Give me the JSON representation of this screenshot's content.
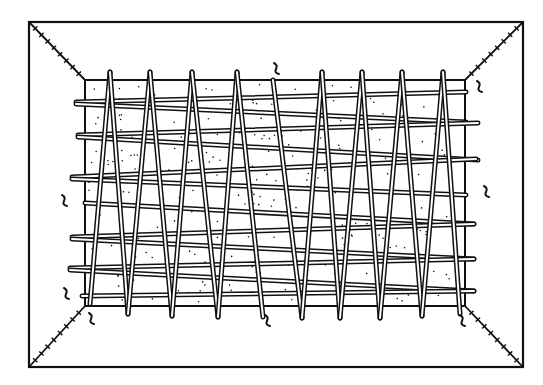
{
  "figure": {
    "colors": {
      "background": "#ffffff",
      "ink": "#111111",
      "panel_fill": "#ffffff"
    },
    "outer_frame": {
      "x1": 29,
      "y1": 22,
      "x2": 523,
      "y2": 367
    },
    "inner_panel": {
      "x1": 85,
      "y1": 80,
      "x2": 465,
      "y2": 306
    },
    "v_sticks": [
      {
        "x1": 90,
        "y1": 304,
        "x2": 110,
        "y2": 72
      },
      {
        "x1": 110,
        "y1": 72,
        "x2": 128,
        "y2": 314
      },
      {
        "x1": 128,
        "y1": 314,
        "x2": 150,
        "y2": 72
      },
      {
        "x1": 150,
        "y1": 72,
        "x2": 172,
        "y2": 316
      },
      {
        "x1": 172,
        "y1": 316,
        "x2": 192,
        "y2": 72
      },
      {
        "x1": 192,
        "y1": 72,
        "x2": 218,
        "y2": 317
      },
      {
        "x1": 218,
        "y1": 317,
        "x2": 237,
        "y2": 72
      },
      {
        "x1": 237,
        "y1": 72,
        "x2": 263,
        "y2": 317
      },
      {
        "x1": 273,
        "y1": 80,
        "x2": 302,
        "y2": 318
      },
      {
        "x1": 302,
        "y1": 318,
        "x2": 322,
        "y2": 72
      },
      {
        "x1": 322,
        "y1": 72,
        "x2": 340,
        "y2": 318
      },
      {
        "x1": 340,
        "y1": 318,
        "x2": 362,
        "y2": 72
      },
      {
        "x1": 362,
        "y1": 72,
        "x2": 380,
        "y2": 318
      },
      {
        "x1": 380,
        "y1": 318,
        "x2": 402,
        "y2": 72
      },
      {
        "x1": 402,
        "y1": 72,
        "x2": 422,
        "y2": 316
      },
      {
        "x1": 422,
        "y1": 316,
        "x2": 443,
        "y2": 72
      },
      {
        "x1": 443,
        "y1": 72,
        "x2": 460,
        "y2": 314
      }
    ],
    "h_sticks": [
      {
        "x1": 76,
        "y1": 102,
        "x2": 466,
        "y2": 92
      },
      {
        "x1": 76,
        "y1": 104,
        "x2": 466,
        "y2": 122
      },
      {
        "x1": 78,
        "y1": 135,
        "x2": 478,
        "y2": 123
      },
      {
        "x1": 78,
        "y1": 137,
        "x2": 478,
        "y2": 160
      },
      {
        "x1": 72,
        "y1": 177,
        "x2": 476,
        "y2": 159
      },
      {
        "x1": 72,
        "y1": 179,
        "x2": 466,
        "y2": 195
      },
      {
        "x1": 85,
        "y1": 203,
        "x2": 474,
        "y2": 224
      },
      {
        "x1": 72,
        "y1": 237,
        "x2": 474,
        "y2": 224
      },
      {
        "x1": 72,
        "y1": 239,
        "x2": 474,
        "y2": 259
      },
      {
        "x1": 70,
        "y1": 268,
        "x2": 474,
        "y2": 259
      },
      {
        "x1": 70,
        "y1": 270,
        "x2": 474,
        "y2": 291
      },
      {
        "x1": 82,
        "y1": 296,
        "x2": 474,
        "y2": 291
      }
    ],
    "corner_seams": [
      {
        "name": "top-left",
        "x1": 29,
        "y1": 22,
        "x2": 85,
        "y2": 80
      },
      {
        "name": "top-right",
        "x1": 523,
        "y1": 22,
        "x2": 465,
        "y2": 80
      },
      {
        "name": "bottom-left",
        "x1": 29,
        "y1": 367,
        "x2": 85,
        "y2": 306
      },
      {
        "name": "bottom-right",
        "x1": 523,
        "y1": 367,
        "x2": 465,
        "y2": 306
      }
    ],
    "ties": [
      {
        "x": 277,
        "y": 68
      },
      {
        "x": 480,
        "y": 86
      },
      {
        "x": 487,
        "y": 191
      },
      {
        "x": 65,
        "y": 200
      },
      {
        "x": 67,
        "y": 293
      },
      {
        "x": 92,
        "y": 318
      },
      {
        "x": 268,
        "y": 320
      },
      {
        "x": 463,
        "y": 320
      }
    ]
  }
}
